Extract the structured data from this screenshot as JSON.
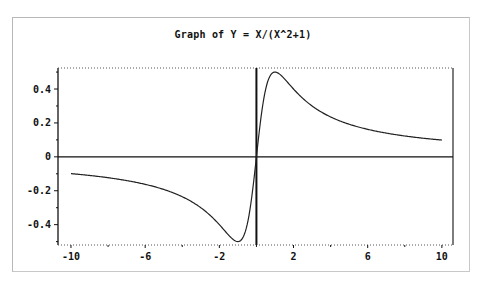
{
  "chart_data": {
    "type": "line",
    "title": "Graph of Y = X/(X^2+1)",
    "xlabel": "",
    "ylabel": "",
    "function": "y = x/(x^2+1)",
    "xlim": [
      -10.7,
      10.6
    ],
    "ylim": [
      -0.52,
      0.524
    ],
    "grid": false,
    "legend": null,
    "x_ticks": [
      -10,
      -6,
      -2,
      2,
      6,
      10
    ],
    "x_tick_labels": [
      "-10",
      "-6",
      "-2",
      "2",
      "6",
      "10"
    ],
    "x_minor_ticks": [
      -8,
      -4,
      0,
      4,
      8
    ],
    "y_ticks": [
      -0.4,
      -0.2,
      0,
      0.2,
      0.4
    ],
    "y_tick_labels": [
      "-0.4",
      "-0.2",
      "0",
      "0.2",
      "0.4"
    ],
    "y_minor_ticks": [
      -0.5,
      -0.3,
      -0.1,
      0.1,
      0.3,
      0.5
    ],
    "reference_lines": {
      "horizontal_y": 0,
      "vertical_x": 0
    },
    "series": [
      {
        "name": "Y = X/(X^2+1)",
        "x": [
          -10,
          -8,
          -6,
          -4,
          -3,
          -2,
          -1.5,
          -1,
          -0.5,
          0,
          0.5,
          1,
          1.5,
          2,
          3,
          4,
          6,
          8,
          10
        ],
        "values": [
          -0.099,
          -0.123,
          -0.162,
          -0.235,
          -0.3,
          -0.4,
          -0.462,
          -0.5,
          -0.4,
          0,
          0.4,
          0.5,
          0.462,
          0.4,
          0.3,
          0.235,
          0.162,
          0.123,
          0.099
        ]
      }
    ]
  },
  "colors": {
    "background": "#ffffff",
    "frame": "#b8b8b8",
    "axis": "#111111",
    "curve": "#222222",
    "dotted_border": "#555555"
  }
}
